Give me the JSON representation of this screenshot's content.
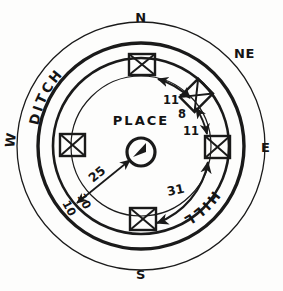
{
  "figure": {
    "ink_color": "#1a1a1a",
    "background_color": "#fdfdfc"
  },
  "compass": {
    "north": "N",
    "northeast": "NE",
    "east": "E",
    "south": "S",
    "west": "W"
  },
  "features": {
    "center_label": "PLACE",
    "upper_left_arc_label": "DITCH",
    "lower_right_arc_label": "HILL"
  },
  "dimensions": {
    "radial": "25",
    "arc_ne_upper": "11",
    "arc_ne_middle": "8",
    "arc_ne_lower": "11",
    "arc_south": "31",
    "arc_west_a": "10",
    "arc_west_b": "10"
  },
  "markers": [
    {
      "name": "station-north",
      "bearing": "N"
    },
    {
      "name": "station-northeast",
      "bearing": "NE"
    },
    {
      "name": "station-east",
      "bearing": "E"
    },
    {
      "name": "station-south",
      "bearing": "S"
    },
    {
      "name": "station-west",
      "bearing": "W"
    }
  ]
}
